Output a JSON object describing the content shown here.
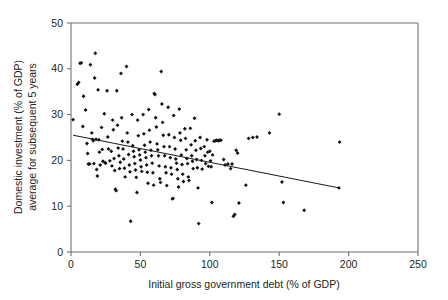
{
  "chart_data": {
    "type": "scatter",
    "title": "",
    "xlabel": "Initial gross government debt (% of GDP)",
    "ylabel_line1": "Domestic investment (% of GDP)",
    "ylabel_line2": "average for subsequent 5 years",
    "xlim": [
      0,
      250
    ],
    "ylim": [
      0,
      50
    ],
    "xticks": [
      0,
      50,
      100,
      150,
      200,
      250
    ],
    "yticks": [
      0,
      10,
      20,
      30,
      40,
      50
    ],
    "xtick_labels": [
      "0",
      "50",
      "100",
      "150",
      "200",
      "250"
    ],
    "ytick_labels": [
      "0",
      "10",
      "20",
      "30",
      "40",
      "50"
    ],
    "grid": false,
    "legend": "none",
    "marker": "diamond",
    "marker_color": "#111111",
    "axis_color": "#6f7271",
    "trendline": {
      "label": "fitted linear trend",
      "color": "#1a1a1a",
      "x": [
        1.5,
        193.0
      ],
      "y": [
        25.5,
        14.0
      ]
    },
    "points": [
      [
        1.5,
        28.9
      ],
      [
        4.5,
        36.6
      ],
      [
        5.5,
        37.0
      ],
      [
        6.5,
        41.2
      ],
      [
        7.5,
        41.3
      ],
      [
        8.5,
        27.4
      ],
      [
        9.0,
        34.0
      ],
      [
        10.5,
        31.0
      ],
      [
        11.5,
        23.7
      ],
      [
        12.0,
        21.5
      ],
      [
        12.5,
        19.2
      ],
      [
        13.5,
        19.2
      ],
      [
        14.0,
        40.9
      ],
      [
        15.0,
        26.0
      ],
      [
        15.5,
        24.6
      ],
      [
        16.0,
        24.3
      ],
      [
        16.5,
        19.3
      ],
      [
        17.0,
        38.0
      ],
      [
        17.5,
        43.4
      ],
      [
        18.0,
        24.6
      ],
      [
        18.5,
        18.0
      ],
      [
        19.0,
        16.6
      ],
      [
        19.5,
        35.4
      ],
      [
        20.0,
        24.5
      ],
      [
        20.5,
        21.8
      ],
      [
        21.0,
        19.0
      ],
      [
        22.0,
        27.2
      ],
      [
        22.5,
        22.4
      ],
      [
        23.0,
        19.8
      ],
      [
        24.0,
        30.2
      ],
      [
        24.5,
        19.5
      ],
      [
        25.0,
        19.4
      ],
      [
        26.0,
        35.2
      ],
      [
        26.5,
        25.1
      ],
      [
        27.0,
        22.5
      ],
      [
        28.0,
        19.9
      ],
      [
        29.0,
        22.0
      ],
      [
        29.5,
        18.8
      ],
      [
        30.0,
        28.8
      ],
      [
        30.5,
        26.7
      ],
      [
        31.0,
        20.4
      ],
      [
        31.5,
        17.8
      ],
      [
        32.0,
        13.7
      ],
      [
        32.5,
        13.4
      ],
      [
        33.0,
        35.2
      ],
      [
        33.5,
        27.7
      ],
      [
        34.0,
        22.7
      ],
      [
        34.5,
        21.0
      ],
      [
        35.0,
        18.2
      ],
      [
        35.5,
        19.6
      ],
      [
        36.0,
        39.0
      ],
      [
        36.5,
        29.3
      ],
      [
        37.0,
        24.2
      ],
      [
        37.5,
        22.5
      ],
      [
        38.0,
        20.3
      ],
      [
        38.5,
        18.3
      ],
      [
        39.0,
        16.4
      ],
      [
        40.0,
        40.5
      ],
      [
        40.5,
        26.0
      ],
      [
        41.0,
        24.0
      ],
      [
        41.5,
        21.3
      ],
      [
        42.0,
        19.0
      ],
      [
        42.5,
        17.5
      ],
      [
        43.0,
        6.7
      ],
      [
        44.0,
        30.0
      ],
      [
        44.5,
        23.2
      ],
      [
        45.0,
        22.0
      ],
      [
        45.5,
        20.8
      ],
      [
        46.0,
        19.3
      ],
      [
        46.5,
        17.9
      ],
      [
        47.0,
        16.3
      ],
      [
        47.5,
        13.0
      ],
      [
        48.0,
        28.8
      ],
      [
        48.5,
        25.4
      ],
      [
        49.0,
        22.3
      ],
      [
        49.5,
        21.2
      ],
      [
        50.0,
        20.1
      ],
      [
        50.5,
        18.6
      ],
      [
        51.0,
        17.6
      ],
      [
        52.0,
        30.0
      ],
      [
        52.5,
        25.8
      ],
      [
        53.0,
        23.3
      ],
      [
        53.5,
        21.8
      ],
      [
        54.0,
        20.6
      ],
      [
        54.5,
        19.0
      ],
      [
        55.0,
        17.4
      ],
      [
        55.5,
        15.0
      ],
      [
        56.0,
        31.1
      ],
      [
        56.5,
        26.6
      ],
      [
        57.0,
        24.0
      ],
      [
        57.5,
        22.2
      ],
      [
        58.0,
        21.0
      ],
      [
        58.5,
        19.4
      ],
      [
        59.0,
        17.3
      ],
      [
        59.5,
        14.6
      ],
      [
        60.0,
        34.6
      ],
      [
        60.5,
        34.4
      ],
      [
        61.0,
        29.3
      ],
      [
        61.5,
        27.3
      ],
      [
        62.0,
        23.6
      ],
      [
        62.5,
        22.3
      ],
      [
        63.0,
        21.0
      ],
      [
        63.5,
        18.8
      ],
      [
        64.0,
        16.0
      ],
      [
        64.5,
        15.2
      ],
      [
        65.0,
        39.4
      ],
      [
        65.5,
        32.3
      ],
      [
        66.0,
        28.3
      ],
      [
        66.5,
        25.5
      ],
      [
        67.0,
        23.0
      ],
      [
        67.5,
        21.0
      ],
      [
        68.0,
        18.6
      ],
      [
        68.5,
        17.3
      ],
      [
        69.0,
        14.5
      ],
      [
        70.0,
        31.6
      ],
      [
        70.5,
        25.6
      ],
      [
        71.0,
        23.0
      ],
      [
        71.5,
        20.6
      ],
      [
        72.0,
        18.4
      ],
      [
        72.5,
        17.0
      ],
      [
        73.0,
        11.6
      ],
      [
        73.5,
        11.7
      ],
      [
        74.0,
        29.8
      ],
      [
        74.5,
        25.0
      ],
      [
        75.0,
        22.5
      ],
      [
        75.5,
        20.3
      ],
      [
        76.0,
        19.4
      ],
      [
        76.5,
        18.0
      ],
      [
        77.0,
        16.0
      ],
      [
        77.5,
        14.2
      ],
      [
        78.0,
        31.2
      ],
      [
        78.5,
        26.0
      ],
      [
        79.0,
        24.4
      ],
      [
        79.5,
        21.2
      ],
      [
        80.0,
        19.1
      ],
      [
        80.5,
        17.0
      ],
      [
        81.0,
        15.4
      ],
      [
        82.0,
        26.9
      ],
      [
        82.5,
        24.8
      ],
      [
        83.0,
        22.3
      ],
      [
        83.5,
        20.4
      ],
      [
        84.0,
        19.3
      ],
      [
        84.5,
        16.4
      ],
      [
        85.0,
        15.6
      ],
      [
        86.0,
        27.0
      ],
      [
        86.5,
        23.4
      ],
      [
        87.0,
        21.0
      ],
      [
        87.5,
        19.8
      ],
      [
        88.0,
        18.2
      ],
      [
        89.0,
        29.2
      ],
      [
        89.5,
        24.3
      ],
      [
        90.0,
        22.2
      ],
      [
        90.5,
        20.2
      ],
      [
        91.0,
        18.4
      ],
      [
        91.5,
        14.0
      ],
      [
        92.0,
        6.2
      ],
      [
        93.0,
        25.0
      ],
      [
        93.5,
        22.6
      ],
      [
        94.0,
        20.0
      ],
      [
        94.5,
        18.1
      ],
      [
        96.0,
        23.0
      ],
      [
        96.5,
        21.0
      ],
      [
        97.0,
        19.3
      ],
      [
        98.0,
        24.5
      ],
      [
        98.5,
        21.8
      ],
      [
        99.0,
        18.7
      ],
      [
        100.0,
        22.0
      ],
      [
        100.5,
        19.9
      ],
      [
        101.0,
        18.6
      ],
      [
        101.5,
        10.8
      ],
      [
        102.0,
        21.2
      ],
      [
        103.0,
        24.2
      ],
      [
        104.0,
        24.3
      ],
      [
        105.0,
        24.4
      ],
      [
        106.0,
        24.3
      ],
      [
        107.0,
        24.4
      ],
      [
        108.0,
        24.4
      ],
      [
        110.0,
        20.2
      ],
      [
        111.0,
        19.0
      ],
      [
        113.0,
        19.2
      ],
      [
        115.0,
        18.2
      ],
      [
        116.0,
        19.2
      ],
      [
        117.0,
        7.8
      ],
      [
        118.0,
        8.2
      ],
      [
        119.0,
        22.2
      ],
      [
        120.0,
        21.6
      ],
      [
        121.0,
        10.7
      ],
      [
        126.0,
        14.6
      ],
      [
        128.0,
        24.8
      ],
      [
        131.0,
        25.0
      ],
      [
        134.0,
        25.1
      ],
      [
        143.0,
        26.0
      ],
      [
        150.0,
        30.1
      ],
      [
        152.0,
        15.3
      ],
      [
        153.0,
        10.8
      ],
      [
        168.0,
        9.1
      ],
      [
        193.0,
        14.0
      ],
      [
        193.5,
        24.0
      ]
    ]
  }
}
